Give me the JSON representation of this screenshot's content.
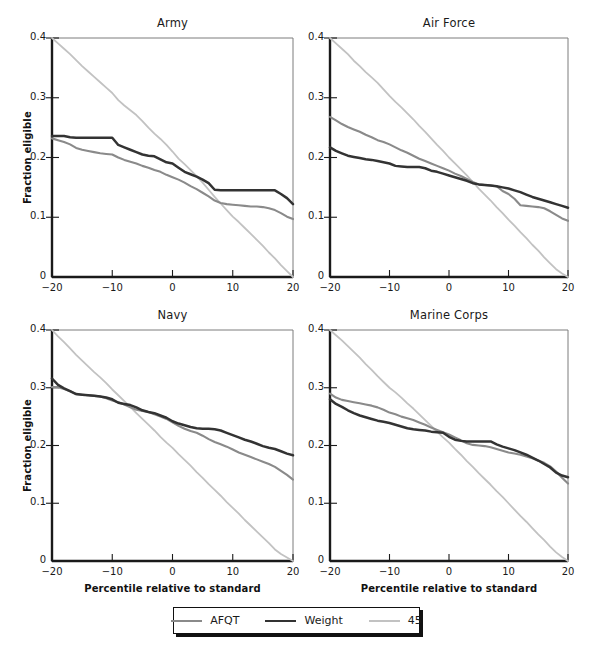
{
  "figure": {
    "width": 595,
    "height": 655,
    "background": "#ffffff"
  },
  "axis_titles": {
    "y": "Fraction eligible",
    "x": "Percentile relative to standard"
  },
  "legend": {
    "entries": [
      {
        "label": "AFQT",
        "color": "#8a8a8a",
        "width": 2.2
      },
      {
        "label": "Weight",
        "color": "#333333",
        "width": 2.6
      },
      {
        "label": "45",
        "color": "#c2c2c2",
        "width": 2.0
      }
    ]
  },
  "colors": {
    "afqt": "#8a8a8a",
    "weight": "#333333",
    "fortyfive": "#c2c2c2",
    "axis": "#1a1a1a",
    "frame": "#7d7d7d"
  },
  "chart_data": {
    "type": "line",
    "xlabel": "Percentile relative to standard",
    "ylabel": "Fraction eligible",
    "xlim": [
      -20,
      20
    ],
    "ylim": [
      0,
      0.4
    ],
    "xticks": [
      -20,
      -10,
      0,
      10,
      20
    ],
    "xticklabels": [
      "−20",
      "−10",
      "0",
      "10",
      "20"
    ],
    "yticks": [
      0,
      0.1,
      0.2,
      0.3,
      0.4
    ],
    "yticklabels": [
      "0",
      "0.1",
      "0.2",
      "0.3",
      "0.4"
    ],
    "grid": false,
    "legend_position": "bottom-center",
    "x": [
      -20,
      -19,
      -18,
      -17,
      -16,
      -15,
      -14,
      -13,
      -12,
      -11,
      -10,
      -9,
      -8,
      -7,
      -6,
      -5,
      -4,
      -3,
      -2,
      -1,
      0,
      1,
      2,
      3,
      4,
      5,
      6,
      7,
      8,
      9,
      10,
      11,
      12,
      13,
      14,
      15,
      16,
      17,
      18,
      19,
      20
    ],
    "panels": [
      {
        "name": "Army",
        "title": "Army",
        "position": "top-left",
        "series": [
          {
            "name": "AFQT",
            "color": "#8a8a8a",
            "values": [
              0.232,
              0.229,
              0.226,
              0.222,
              0.216,
              0.213,
              0.211,
              0.209,
              0.207,
              0.206,
              0.205,
              0.2,
              0.196,
              0.193,
              0.19,
              0.186,
              0.183,
              0.179,
              0.176,
              0.171,
              0.167,
              0.163,
              0.158,
              0.152,
              0.147,
              0.141,
              0.135,
              0.128,
              0.124,
              0.122,
              0.121,
              0.12,
              0.119,
              0.118,
              0.118,
              0.117,
              0.115,
              0.112,
              0.107,
              0.101,
              0.097
            ]
          },
          {
            "name": "Weight",
            "color": "#333333",
            "values": [
              0.236,
              0.236,
              0.236,
              0.234,
              0.233,
              0.233,
              0.233,
              0.233,
              0.233,
              0.233,
              0.233,
              0.221,
              0.217,
              0.213,
              0.209,
              0.205,
              0.203,
              0.202,
              0.197,
              0.192,
              0.19,
              0.183,
              0.176,
              0.172,
              0.168,
              0.163,
              0.157,
              0.146,
              0.145,
              0.145,
              0.145,
              0.145,
              0.145,
              0.145,
              0.145,
              0.145,
              0.145,
              0.145,
              0.139,
              0.132,
              0.122
            ]
          },
          {
            "name": "45",
            "color": "#c2c2c2",
            "values": [
              0.4,
              0.391,
              0.382,
              0.373,
              0.363,
              0.353,
              0.344,
              0.335,
              0.326,
              0.317,
              0.308,
              0.296,
              0.287,
              0.279,
              0.271,
              0.261,
              0.25,
              0.24,
              0.231,
              0.221,
              0.21,
              0.198,
              0.189,
              0.179,
              0.169,
              0.158,
              0.146,
              0.134,
              0.123,
              0.112,
              0.101,
              0.092,
              0.082,
              0.072,
              0.062,
              0.052,
              0.041,
              0.031,
              0.02,
              0.01,
              0.0
            ]
          }
        ]
      },
      {
        "name": "Air Force",
        "title": "Air Force",
        "position": "top-right",
        "series": [
          {
            "name": "AFQT",
            "color": "#8a8a8a",
            "values": [
              0.268,
              0.262,
              0.256,
              0.251,
              0.247,
              0.243,
              0.238,
              0.234,
              0.229,
              0.226,
              0.222,
              0.217,
              0.212,
              0.208,
              0.203,
              0.198,
              0.194,
              0.19,
              0.186,
              0.182,
              0.178,
              0.173,
              0.169,
              0.164,
              0.159,
              0.155,
              0.154,
              0.153,
              0.152,
              0.144,
              0.139,
              0.131,
              0.12,
              0.119,
              0.118,
              0.117,
              0.115,
              0.11,
              0.104,
              0.098,
              0.094
            ]
          },
          {
            "name": "Weight",
            "color": "#333333",
            "values": [
              0.217,
              0.211,
              0.207,
              0.203,
              0.201,
              0.199,
              0.197,
              0.196,
              0.194,
              0.192,
              0.19,
              0.186,
              0.185,
              0.184,
              0.184,
              0.184,
              0.182,
              0.178,
              0.176,
              0.173,
              0.17,
              0.167,
              0.164,
              0.161,
              0.157,
              0.155,
              0.154,
              0.153,
              0.152,
              0.15,
              0.148,
              0.145,
              0.142,
              0.138,
              0.134,
              0.131,
              0.128,
              0.125,
              0.122,
              0.119,
              0.116
            ]
          },
          {
            "name": "45",
            "color": "#c2c2c2",
            "values": [
              0.4,
              0.391,
              0.382,
              0.373,
              0.362,
              0.353,
              0.343,
              0.334,
              0.325,
              0.314,
              0.303,
              0.293,
              0.284,
              0.274,
              0.264,
              0.253,
              0.243,
              0.232,
              0.221,
              0.211,
              0.2,
              0.19,
              0.18,
              0.17,
              0.159,
              0.148,
              0.138,
              0.128,
              0.117,
              0.107,
              0.096,
              0.086,
              0.075,
              0.065,
              0.054,
              0.044,
              0.033,
              0.023,
              0.013,
              0.006,
              0.0
            ]
          }
        ]
      },
      {
        "name": "Navy",
        "title": "Navy",
        "position": "bottom-left",
        "series": [
          {
            "name": "AFQT",
            "color": "#8a8a8a",
            "values": [
              0.301,
              0.301,
              0.298,
              0.294,
              0.289,
              0.288,
              0.287,
              0.286,
              0.285,
              0.282,
              0.278,
              0.275,
              0.271,
              0.266,
              0.262,
              0.26,
              0.258,
              0.254,
              0.25,
              0.246,
              0.24,
              0.234,
              0.229,
              0.225,
              0.222,
              0.217,
              0.211,
              0.206,
              0.202,
              0.198,
              0.193,
              0.188,
              0.184,
              0.18,
              0.176,
              0.172,
              0.168,
              0.163,
              0.156,
              0.149,
              0.141
            ]
          },
          {
            "name": "Weight",
            "color": "#333333",
            "values": [
              0.316,
              0.305,
              0.299,
              0.294,
              0.289,
              0.288,
              0.287,
              0.286,
              0.285,
              0.283,
              0.28,
              0.274,
              0.272,
              0.27,
              0.266,
              0.261,
              0.258,
              0.256,
              0.252,
              0.248,
              0.242,
              0.238,
              0.235,
              0.232,
              0.23,
              0.229,
              0.229,
              0.228,
              0.226,
              0.222,
              0.218,
              0.214,
              0.21,
              0.207,
              0.203,
              0.199,
              0.196,
              0.194,
              0.19,
              0.186,
              0.183
            ]
          },
          {
            "name": "45",
            "color": "#c2c2c2",
            "values": [
              0.4,
              0.389,
              0.379,
              0.368,
              0.357,
              0.347,
              0.337,
              0.327,
              0.318,
              0.308,
              0.297,
              0.287,
              0.277,
              0.267,
              0.256,
              0.246,
              0.236,
              0.226,
              0.215,
              0.205,
              0.196,
              0.185,
              0.175,
              0.165,
              0.154,
              0.144,
              0.133,
              0.123,
              0.113,
              0.102,
              0.092,
              0.082,
              0.071,
              0.061,
              0.051,
              0.041,
              0.031,
              0.02,
              0.012,
              0.006,
              0.0
            ]
          }
        ]
      },
      {
        "name": "Marine Corps",
        "title": "Marine Corps",
        "position": "bottom-right",
        "series": [
          {
            "name": "AFQT",
            "color": "#8a8a8a",
            "values": [
              0.29,
              0.283,
              0.279,
              0.277,
              0.275,
              0.273,
              0.271,
              0.269,
              0.266,
              0.262,
              0.257,
              0.254,
              0.25,
              0.247,
              0.244,
              0.24,
              0.236,
              0.231,
              0.227,
              0.223,
              0.219,
              0.214,
              0.209,
              0.204,
              0.201,
              0.2,
              0.199,
              0.197,
              0.194,
              0.191,
              0.188,
              0.186,
              0.184,
              0.181,
              0.178,
              0.174,
              0.17,
              0.164,
              0.155,
              0.144,
              0.134
            ]
          },
          {
            "name": "Weight",
            "color": "#333333",
            "values": [
              0.28,
              0.272,
              0.267,
              0.261,
              0.256,
              0.252,
              0.249,
              0.246,
              0.243,
              0.241,
              0.239,
              0.236,
              0.233,
              0.23,
              0.228,
              0.227,
              0.226,
              0.224,
              0.223,
              0.222,
              0.215,
              0.21,
              0.208,
              0.207,
              0.207,
              0.207,
              0.207,
              0.207,
              0.202,
              0.198,
              0.195,
              0.192,
              0.188,
              0.184,
              0.179,
              0.174,
              0.168,
              0.162,
              0.153,
              0.148,
              0.145
            ]
          },
          {
            "name": "45",
            "color": "#c2c2c2",
            "values": [
              0.4,
              0.391,
              0.382,
              0.372,
              0.362,
              0.352,
              0.341,
              0.331,
              0.32,
              0.31,
              0.3,
              0.292,
              0.283,
              0.273,
              0.264,
              0.254,
              0.244,
              0.234,
              0.224,
              0.214,
              0.205,
              0.194,
              0.184,
              0.173,
              0.163,
              0.152,
              0.142,
              0.132,
              0.121,
              0.111,
              0.1,
              0.089,
              0.078,
              0.068,
              0.057,
              0.046,
              0.036,
              0.025,
              0.015,
              0.007,
              0.0
            ]
          }
        ]
      }
    ]
  }
}
